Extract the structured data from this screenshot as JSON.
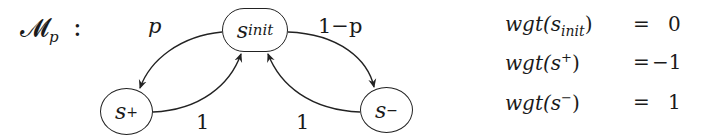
{
  "diagram": {
    "title": {
      "base": "𝓜",
      "sub": "p",
      "colon": ":"
    },
    "nodes": [
      {
        "id": "s_init",
        "base": "s",
        "sub": "init"
      },
      {
        "id": "s_plus",
        "base": "s",
        "sup": "+"
      },
      {
        "id": "s_minus",
        "base": "s",
        "sup": "−"
      }
    ],
    "edges": [
      {
        "from": "s_init",
        "to": "s_plus",
        "label": "p"
      },
      {
        "from": "s_init",
        "to": "s_minus",
        "label": "1−p"
      },
      {
        "from": "s_plus",
        "to": "s_init",
        "label": "1"
      },
      {
        "from": "s_minus",
        "to": "s_init",
        "label": "1"
      }
    ],
    "weights": [
      {
        "fn": "wgt(",
        "base": "s",
        "sub": "init",
        "sup": "",
        "close": ")",
        "eq": "=",
        "value": "0"
      },
      {
        "fn": "wgt(",
        "base": "s",
        "sub": "",
        "sup": "+",
        "close": ")",
        "eq": "=",
        "value": "−1"
      },
      {
        "fn": "wgt(",
        "base": "s",
        "sub": "",
        "sup": "−",
        "close": ")",
        "eq": "=",
        "value": "1"
      }
    ]
  }
}
